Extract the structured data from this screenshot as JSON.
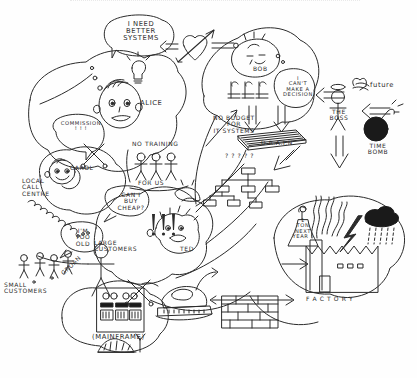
{
  "meta": {
    "style": "hand-drawn black ink sketch on white paper",
    "width": 417,
    "height": 378,
    "ink_color": "#2b2b2b",
    "paper_color": "#fefefe"
  },
  "characters": [
    {
      "id": "alice",
      "name": "ALICE",
      "speech": "I NEED\nBETTER\nSYSTEMS",
      "icon": "lightbulb-idea-icon"
    },
    {
      "id": "bob",
      "name": "BOB",
      "speech": "I\nCAN'T\nMAKE A\nDECISION",
      "money": "£ £ £"
    },
    {
      "id": "carol",
      "name": "CAROL",
      "speech": "COMMISSION\n! ! !"
    },
    {
      "id": "ted",
      "name": "TED",
      "speech": "! ! !"
    },
    {
      "id": "boss",
      "name": "THE\nBOSS",
      "icon": "angel-halo-stick-figure-icon"
    }
  ],
  "annotations": [
    {
      "id": "no-training",
      "text": "NO TRAINING",
      "sub": "FOR US"
    },
    {
      "id": "no-budget",
      "text": "NO BUDGET\nFOR\nIT SYSTEMS"
    },
    {
      "id": "drain",
      "text": "D.R.A.I.N"
    },
    {
      "id": "local-call-centre",
      "text": "LOCAL\nCALL\nCENTRE"
    },
    {
      "id": "large-customers",
      "text": "LARGE\nCUSTOMERS"
    },
    {
      "id": "small-customers",
      "text": "SMALL\nCUSTOMERS"
    },
    {
      "id": "buy-cheaper",
      "text": "CAN I\nBUY\nCHEAP?"
    },
    {
      "id": "too-old",
      "text": "I'M\nTOO\nOLD"
    },
    {
      "id": "groan",
      "text": "GROAN"
    },
    {
      "id": "mainframe",
      "text": "(MAINFRAME)"
    },
    {
      "id": "one-ton",
      "text": "1\nTON\nNEXT\nYEAR !"
    },
    {
      "id": "org-chart-query",
      "text": "? ? ? ? ?"
    },
    {
      "id": "future",
      "text": "future"
    },
    {
      "id": "time-bomb",
      "text": "TIME\nBOMB"
    },
    {
      "id": "factory",
      "text": "F A C T O R Y"
    }
  ],
  "symbols": [
    {
      "id": "heart-arrow",
      "name": "heart-pierced-by-arrow-icon"
    },
    {
      "id": "crossed-swords-a",
      "name": "crossed-swords-conflict-icon"
    },
    {
      "id": "crossed-swords-b",
      "name": "crossed-swords-conflict-icon"
    },
    {
      "id": "drain-grate",
      "name": "drain-grate-icon"
    },
    {
      "id": "org-chart",
      "name": "org-chart-icon"
    },
    {
      "id": "bomb",
      "name": "bomb-icon"
    },
    {
      "id": "winged-future",
      "name": "winged-future-icon"
    },
    {
      "id": "mainframe-cabinet",
      "name": "mainframe-cabinet-icon"
    },
    {
      "id": "iron-press",
      "name": "steam-iron-icon"
    },
    {
      "id": "brick-wall",
      "name": "brick-wall-icon"
    },
    {
      "id": "factory-building",
      "name": "factory-building-icon"
    },
    {
      "id": "rain-cloud",
      "name": "rain-cloud-icon"
    },
    {
      "id": "lightning-bolt",
      "name": "lightning-bolt-icon"
    },
    {
      "id": "smoke-plume",
      "name": "smoke-plume-icon"
    },
    {
      "id": "molehill",
      "name": "molehill-antenna-icon"
    },
    {
      "id": "coil-spring",
      "name": "coil-spring-icon"
    },
    {
      "id": "bell-weight",
      "name": "bell-weight-icon"
    }
  ],
  "arrows": [
    {
      "id": "heart-to-alice",
      "from": "heart-arrow",
      "to": "alice",
      "direction": "left"
    },
    {
      "id": "bob-to-heart",
      "from": "bob",
      "to": "heart-arrow",
      "direction": "left"
    },
    {
      "id": "bob-to-drain",
      "from": "bob",
      "to": "drain",
      "direction": "down"
    },
    {
      "id": "money-to-drain",
      "from": "money",
      "to": "drain",
      "direction": "down"
    },
    {
      "id": "boss-to-bob",
      "from": "boss",
      "to": "bob",
      "direction": "left"
    },
    {
      "id": "bomb-to-boss",
      "from": "bomb",
      "to": "boss",
      "direction": "left"
    },
    {
      "id": "boss-down",
      "from": "boss",
      "to": "factory-area",
      "direction": "down"
    },
    {
      "id": "drain-down-left",
      "from": "drain",
      "to": "org-chart",
      "direction": "down-left"
    },
    {
      "id": "iron-to-factory",
      "from": "iron-press",
      "to": "factory",
      "direction": "right"
    },
    {
      "id": "factory-to-smoke",
      "from": "factory",
      "to": "smoke",
      "direction": "right"
    }
  ]
}
